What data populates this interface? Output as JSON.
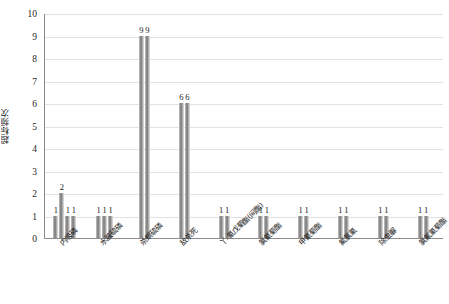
{
  "chart_data": {
    "type": "bar",
    "title": "",
    "xlabel": "",
    "ylabel": "超标频次",
    "ylim": [
      0,
      10
    ],
    "ytick_labels": [
      "10",
      "9",
      "8",
      "7",
      "6",
      "5",
      "4",
      "3",
      "2",
      "1",
      "0"
    ],
    "ytick_values": [
      10,
      9,
      8,
      7,
      6,
      5,
      4,
      3,
      2,
      1,
      0
    ],
    "grid": true,
    "legend": "none",
    "categories": [
      "内吸磷",
      "水胺硫磷",
      "杀螟硫磷",
      "敌杀死",
      "丫-氰戊菊酯(间酯)",
      "氯氰菊酯",
      "甲氰菊酯",
      "氟氯氰",
      "除虫脲",
      "氯氟氰菊酯"
    ],
    "groups": [
      {
        "category": "内吸磷",
        "values": [
          1,
          2,
          1,
          1
        ]
      },
      {
        "category": "水胺硫磷",
        "values": [
          1,
          1,
          1
        ]
      },
      {
        "category": "杀螟硫磷",
        "values": [
          9,
          9
        ]
      },
      {
        "category": "敌杀死",
        "values": [
          6,
          6
        ]
      },
      {
        "category": "丫-氰戊菊酯(间酯)",
        "values": [
          1,
          1
        ]
      },
      {
        "category": "氯氰菊酯",
        "values": [
          1,
          1
        ]
      },
      {
        "category": "甲氰菊酯",
        "values": [
          1,
          1
        ]
      },
      {
        "category": "氟氯氰",
        "values": [
          1,
          1
        ]
      },
      {
        "category": "除虫脲",
        "values": [
          1,
          1
        ]
      },
      {
        "category": "氯氟氰菊酯",
        "values": [
          1,
          1
        ]
      }
    ],
    "colors": {
      "bar_fill_light": "#c9c9c9",
      "bar_fill_dark": "#767676",
      "gridline": "#e2e2e2",
      "axis_line": "#8c8c8c",
      "text": "#1a1a1a",
      "background": "#ffffff"
    }
  }
}
